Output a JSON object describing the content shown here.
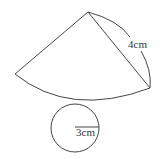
{
  "diagram": {
    "type": "cone-net",
    "sector": {
      "slant_label": "4cm",
      "apex": [
        88,
        12
      ],
      "left_end": [
        15,
        74
      ],
      "right_end": [
        150,
        88
      ]
    },
    "base_circle": {
      "radius_label": "3cm",
      "center": [
        75,
        128
      ],
      "radius_px": 24
    },
    "colors": {
      "stroke": "#444444",
      "text": "#333333",
      "background": "#ffffff"
    }
  }
}
